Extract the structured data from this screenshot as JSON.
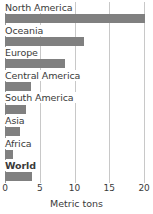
{
  "chart_data": {
    "type": "bar",
    "orientation": "horizontal",
    "title": "",
    "xlabel": "Metric tons",
    "ylabel": "",
    "xlim": [
      0,
      20.7
    ],
    "xticks": [
      0,
      5,
      10,
      15,
      20
    ],
    "xtick_labels": [
      "0",
      "5",
      "10",
      "15",
      "20"
    ],
    "grid": true,
    "grid_axis": "x",
    "legend": "none",
    "bar_color": "#808080",
    "gridline_color": "#c8c8c8",
    "axis_color": "#9a9a9a",
    "categories": [
      "North America",
      "Oceania",
      "Europe",
      "Central America",
      "South America",
      "Asia",
      "Africa",
      "World"
    ],
    "values": [
      20.1,
      11.4,
      8.6,
      3.7,
      3.0,
      2.2,
      1.1,
      3.9
    ],
    "emphasis": [
      "World"
    ]
  }
}
